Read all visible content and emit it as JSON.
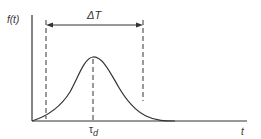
{
  "diagram": {
    "type": "pulse-waveform",
    "y_axis_label": "f(t)",
    "x_axis_label": "t",
    "interval_label": "ΔT",
    "peak_label_main": "τ",
    "peak_label_sub": "d"
  },
  "colors": {
    "line": "#333333",
    "background": "#ffffff"
  }
}
